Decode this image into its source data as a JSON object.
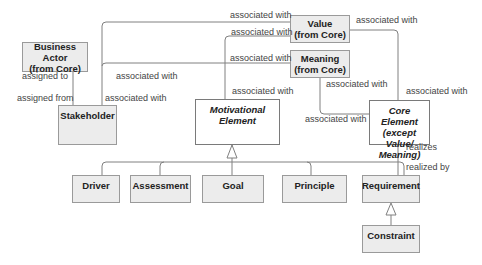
{
  "diagram": {
    "type": "motivation-metamodel",
    "nodes": {
      "business_actor": {
        "line1": "Business Actor",
        "line2": "(from Core)"
      },
      "stakeholder": {
        "label": "Stakeholder"
      },
      "motivational_element": {
        "line1": "Motivational",
        "line2": "Element"
      },
      "value": {
        "line1": "Value",
        "line2": "(from Core)"
      },
      "meaning": {
        "line1": "Meaning",
        "line2": "(from Core)"
      },
      "core_element": {
        "line1": "Core Element",
        "line2": "(except Value/",
        "line3": "Meaning)"
      },
      "driver": {
        "label": "Driver"
      },
      "assessment": {
        "label": "Assessment"
      },
      "goal": {
        "label": "Goal"
      },
      "principle": {
        "label": "Principle"
      },
      "requirement": {
        "label": "Requirement"
      },
      "constraint": {
        "label": "Constraint"
      }
    },
    "labels": {
      "assigned_to": "assigned to",
      "assigned_from": "assigned from",
      "stakeholder_assoc_1": "associated with",
      "stakeholder_assoc_2": "associated with",
      "value_assoc_top": "associated with",
      "value_assoc_mid": "associated with",
      "meaning_assoc_left": "associated with",
      "motivational_assoc": "associated with",
      "value_assoc_right": "associated with",
      "meaning_assoc_below": "associated with",
      "core_assoc_right": "associated with",
      "core_assoc_left": "associated with",
      "realizes": "realizes",
      "realized_by": "realized by"
    }
  }
}
